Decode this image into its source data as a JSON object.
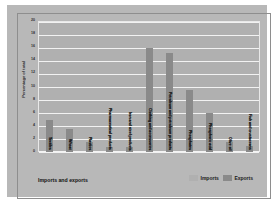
{
  "chart_data": {
    "type": "bar",
    "title": "",
    "xlabel": "Imports and exports",
    "ylabel": "Percentage of total",
    "ylim": [
      0,
      20
    ],
    "yticks": [
      20,
      18,
      16,
      14,
      12,
      10,
      8,
      6,
      4,
      2,
      0
    ],
    "grid": true,
    "legend_position": "bottom-right",
    "categories": [
      "Textiles",
      "Wheat",
      "Plastics",
      "Pharmaceutical products",
      "Iron and steel products",
      "Clothing and accessories",
      "Petroleum and petroleum products",
      "Phosphates",
      "Phosphoric acid",
      "Olive oil",
      "Fish and crustaceans"
    ],
    "values": [
      5,
      3.5,
      1.5,
      0.8,
      0.8,
      16,
      15.3,
      9.5,
      6,
      1.5,
      1
    ],
    "series": [
      {
        "name": "Exports",
        "values": [
          5,
          3.5,
          1.5,
          0.8,
          0.8,
          16,
          15.3,
          9.5,
          6,
          1.5,
          1
        ]
      }
    ],
    "legend": [
      {
        "label": "Imports",
        "color": "#b0b0b0"
      },
      {
        "label": "Exports",
        "color": "#8a8a8a"
      }
    ],
    "colors": {
      "background": "#b8b8b8",
      "plot_area": "#b0b0b0",
      "gridline": "#f2f2f2",
      "bar": "#8a8a8a",
      "border": "#8e8e8e",
      "text": "#1f1f1f"
    }
  }
}
